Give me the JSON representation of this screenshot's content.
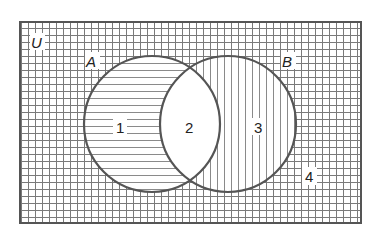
{
  "diagram": {
    "type": "venn",
    "universe_label": "U",
    "sets": [
      {
        "label": "A",
        "cx": 152,
        "cy": 124,
        "r": 68,
        "hatch": "horizontal"
      },
      {
        "label": "B",
        "cx": 228,
        "cy": 124,
        "r": 68,
        "hatch": "vertical"
      }
    ],
    "regions": [
      {
        "id": "1",
        "label": "1",
        "description": "A only",
        "fill": "horizontal-lines"
      },
      {
        "id": "2",
        "label": "2",
        "description": "A and B",
        "fill": "none"
      },
      {
        "id": "3",
        "label": "3",
        "description": "B only",
        "fill": "vertical-lines"
      },
      {
        "id": "4",
        "label": "4",
        "description": "outside A and B",
        "fill": "grid"
      }
    ],
    "colors": {
      "background": "#ffffff",
      "outline": "#555555",
      "hatch": "#7a7a7a",
      "text": "#222222"
    }
  }
}
